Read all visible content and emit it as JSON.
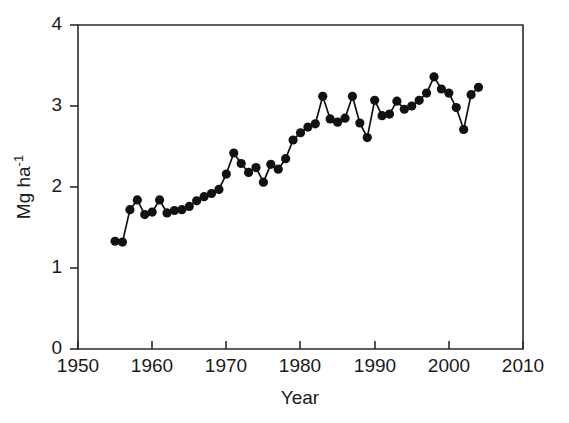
{
  "chart_data": {
    "type": "line",
    "title": "",
    "subtitle": "",
    "xlabel": "Year",
    "ylabel": "Mg ha⁻¹",
    "ylabel_parts": {
      "base": "Mg ha",
      "exponent": "-1"
    },
    "xlim": [
      1950,
      2010
    ],
    "ylim": [
      0,
      4
    ],
    "xticks": [
      1950,
      1960,
      1970,
      1980,
      1990,
      2000,
      2010
    ],
    "xtick_labels": [
      "1950",
      "1960",
      "1970",
      "1980",
      "1990",
      "2000",
      "2010"
    ],
    "yticks": [
      0,
      1,
      2,
      3,
      4
    ],
    "ytick_labels": [
      "0",
      "1",
      "2",
      "3",
      "4"
    ],
    "grid": false,
    "legend": null,
    "legend_position": "none",
    "marker": "filled-circle",
    "marker_color": "#111111",
    "line_color": "#111111",
    "axis_color": "#2b2b2b",
    "background_color": "#ffffff",
    "frame": "box",
    "x": [
      1955,
      1956,
      1957,
      1958,
      1959,
      1960,
      1961,
      1962,
      1963,
      1964,
      1965,
      1966,
      1967,
      1968,
      1969,
      1970,
      1971,
      1972,
      1973,
      1974,
      1975,
      1976,
      1977,
      1978,
      1979,
      1980,
      1981,
      1982,
      1983,
      1984,
      1985,
      1986,
      1987,
      1988,
      1989,
      1990,
      1991,
      1992,
      1993,
      1994,
      1995,
      1996,
      1997,
      1998,
      1999,
      2000,
      2001,
      2002,
      2003,
      2004
    ],
    "y": [
      1.33,
      1.32,
      1.72,
      1.84,
      1.66,
      1.69,
      1.84,
      1.68,
      1.71,
      1.72,
      1.76,
      1.83,
      1.88,
      1.92,
      1.97,
      2.16,
      2.42,
      2.29,
      2.18,
      2.24,
      2.06,
      2.28,
      2.22,
      2.35,
      2.58,
      2.67,
      2.74,
      2.78,
      3.12,
      2.84,
      2.8,
      2.85,
      3.12,
      2.79,
      2.61,
      3.07,
      2.88,
      2.9,
      3.06,
      2.96,
      3.0,
      3.07,
      3.16,
      3.36,
      3.21,
      3.16,
      2.98,
      2.71,
      3.14,
      3.23
    ],
    "series": [
      {
        "name": "yield",
        "values": [
          1.33,
          1.32,
          1.72,
          1.84,
          1.66,
          1.69,
          1.84,
          1.68,
          1.71,
          1.72,
          1.76,
          1.83,
          1.88,
          1.92,
          1.97,
          2.16,
          2.42,
          2.29,
          2.18,
          2.24,
          2.06,
          2.28,
          2.22,
          2.35,
          2.58,
          2.67,
          2.74,
          2.78,
          3.12,
          2.84,
          2.8,
          2.85,
          3.12,
          2.79,
          2.61,
          3.07,
          2.88,
          2.9,
          3.06,
          2.96,
          3.0,
          3.07,
          3.16,
          3.36,
          3.21,
          3.16,
          2.98,
          2.71,
          3.14,
          3.23
        ]
      }
    ],
    "annotations": []
  }
}
